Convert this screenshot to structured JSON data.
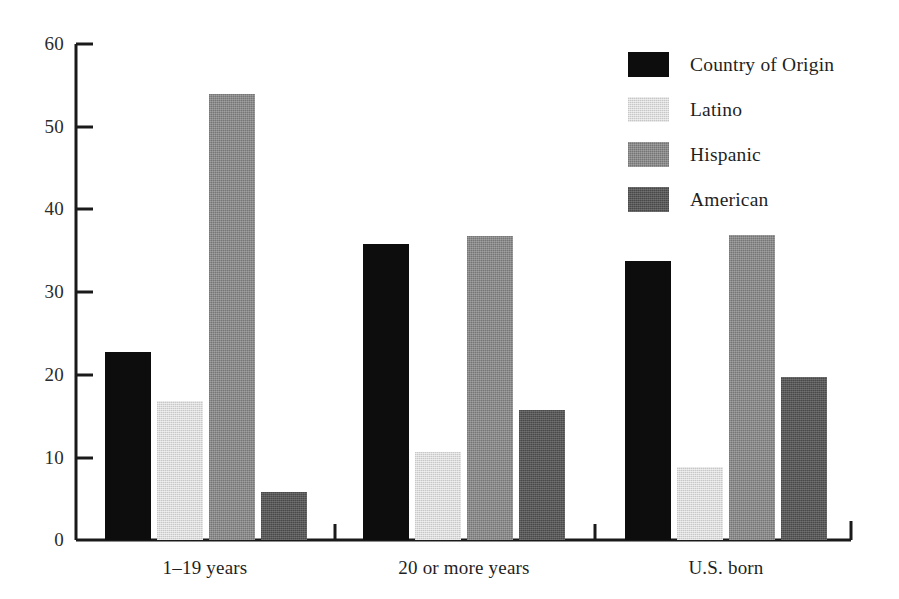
{
  "chart_data": {
    "type": "bar",
    "title": "",
    "subtitle": "",
    "xlabel": "",
    "ylabel": "",
    "categories": [
      "1–19 years",
      "20 or more years",
      "U.S. born"
    ],
    "series": [
      {
        "name": "Country of Origin",
        "color": "#0d0d0d",
        "values": [
          22.7,
          35.8,
          33.7
        ]
      },
      {
        "name": "Latino",
        "color": "#dcdcdc",
        "values": [
          16.8,
          10.7,
          8.8
        ]
      },
      {
        "name": "Hispanic",
        "color": "#8b8b8b",
        "values": [
          54.0,
          36.8,
          36.9
        ]
      },
      {
        "name": "American",
        "color": "#595959",
        "values": [
          5.8,
          15.7,
          19.7
        ]
      }
    ],
    "ylim": [
      0,
      60
    ],
    "yticks": [
      0,
      10,
      20,
      30,
      40,
      50,
      60
    ],
    "ytick_labels": [
      "0",
      "10",
      "20",
      "30",
      "40",
      "50",
      "60"
    ],
    "grid": false,
    "legend_position": "top-right",
    "axis_color": "#1a1a1a",
    "background": "#ffffff"
  },
  "legend": {
    "items": [
      {
        "label": "Country of Origin",
        "swatch": "swatch-black"
      },
      {
        "label": "Latino",
        "swatch": "swatch-light"
      },
      {
        "label": "Hispanic",
        "swatch": "swatch-mid"
      },
      {
        "label": "American",
        "swatch": "swatch-dark"
      }
    ]
  },
  "axes": {
    "y_labels": [
      "60",
      "50",
      "40",
      "30",
      "20",
      "10",
      "0"
    ],
    "x_labels": [
      "1–19 years",
      "20 or more years",
      "U.S. born"
    ]
  }
}
